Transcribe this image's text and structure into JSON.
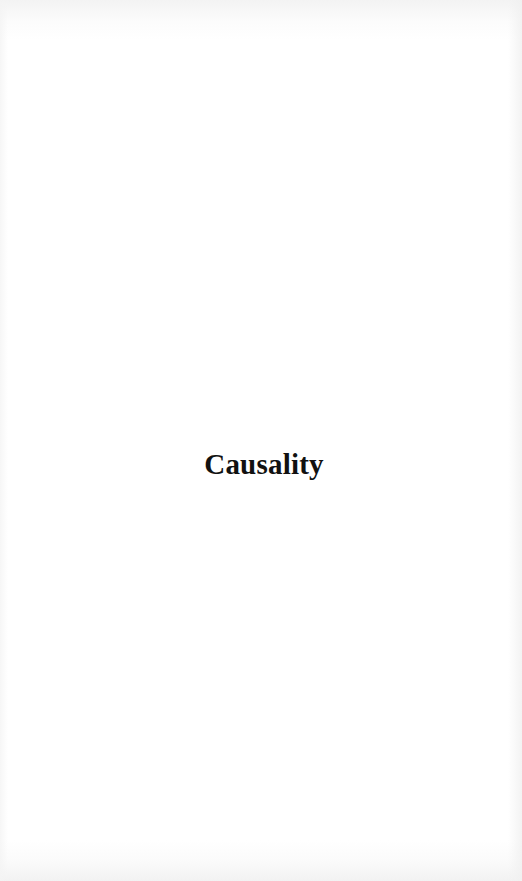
{
  "page": {
    "title": "Causality",
    "background_color": "#ffffff",
    "text_color": "#111111"
  }
}
